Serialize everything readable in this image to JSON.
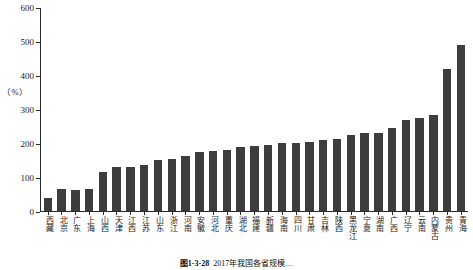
{
  "chart_data": {
    "type": "bar",
    "title": "",
    "xlabel": "",
    "ylabel": "（%）",
    "ylim": [
      0,
      600
    ],
    "yticks": [
      0,
      100,
      200,
      300,
      400,
      500,
      600
    ],
    "grid": false,
    "legend": "none",
    "bar_color": "#3d3d3d",
    "axis_color": "#2b2b2b",
    "categories": [
      "西藏",
      "北京",
      "广东",
      "上海",
      "山西",
      "天津",
      "江西",
      "江苏",
      "山东",
      "浙江",
      "河南",
      "安徽",
      "河北",
      "重庆",
      "湖北",
      "福建",
      "新疆",
      "海南",
      "四川",
      "甘肃",
      "吉林",
      "陕西",
      "黑龙江",
      "宁夏",
      "湖南",
      "广西",
      "辽宁",
      "云南",
      "内蒙古",
      "贵州",
      "青海"
    ],
    "values": [
      38,
      65,
      62,
      65,
      115,
      130,
      130,
      135,
      152,
      155,
      163,
      175,
      178,
      180,
      190,
      192,
      196,
      200,
      200,
      205,
      210,
      212,
      225,
      232,
      232,
      245,
      270,
      276,
      285,
      420,
      490
    ]
  },
  "caption": {
    "number": "图1-3-28",
    "text": "2017年我国各省规模…"
  }
}
